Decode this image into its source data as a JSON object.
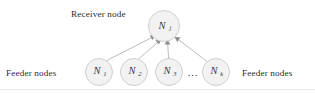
{
  "figure": {
    "type": "node-graph-diagram",
    "background_color": "#ffffff",
    "labels": {
      "receiver_caption": "Receiver node",
      "feeder_caption_left": "Feeder nodes",
      "feeder_caption_right": "Feeder nodes",
      "ellipsis": "..."
    },
    "receiver_node": {
      "base": "N",
      "subscript": "j",
      "cx": 164,
      "cy": 26,
      "r": 15.5
    },
    "feeder_nodes": [
      {
        "base": "N",
        "subscript": "1",
        "cx": 99,
        "cy": 72,
        "r": 13.5
      },
      {
        "base": "N",
        "subscript": "2",
        "cx": 134,
        "cy": 72,
        "r": 13.5
      },
      {
        "base": "N",
        "subscript": "3",
        "cx": 169,
        "cy": 72,
        "r": 13.5
      },
      {
        "base": "N",
        "subscript": "k",
        "cx": 216,
        "cy": 72,
        "r": 13.5
      }
    ],
    "ellipsis_position": {
      "x": 193,
      "y": 75
    },
    "edges": [
      {
        "from": "N1",
        "to": "Nj"
      },
      {
        "from": "N2",
        "to": "Nj"
      },
      {
        "from": "N3",
        "to": "Nj"
      },
      {
        "from": "Nk",
        "to": "Nj"
      }
    ],
    "colors": {
      "node_fill": "#f2f2f2",
      "node_stroke": "#c9c9c9",
      "edge": "#b0b0b0",
      "arrow": "#8e8e8e",
      "text": "#2e2e2e",
      "frame_rule": "#e2e2e2"
    },
    "caption_positions": {
      "receiver": {
        "x": 71,
        "y": 17
      },
      "feeder_left": {
        "x": 6,
        "y": 75
      },
      "feeder_right": {
        "x": 242,
        "y": 75
      }
    }
  }
}
